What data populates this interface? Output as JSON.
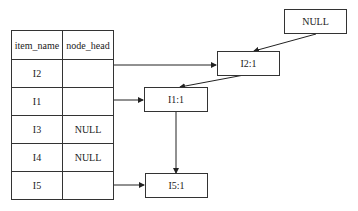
{
  "table": {
    "headers": [
      "item_name",
      "node_head"
    ],
    "rows": [
      {
        "item_name": "I2",
        "node_head": ""
      },
      {
        "item_name": "I1",
        "node_head": ""
      },
      {
        "item_name": "I3",
        "node_head": "NULL"
      },
      {
        "item_name": "I4",
        "node_head": "NULL"
      },
      {
        "item_name": "I5",
        "node_head": ""
      }
    ]
  },
  "nodes": {
    "null_node": "NULL",
    "i2_node": "I2:1",
    "i1_node": "I1:1",
    "i5_node": "I5:1"
  },
  "edges": [
    {
      "from": "I2 row",
      "to": "I2:1"
    },
    {
      "from": "I1 row",
      "to": "I1:1"
    },
    {
      "from": "I5 row",
      "to": "I5:1"
    },
    {
      "from": "NULL",
      "to": "I2:1"
    },
    {
      "from": "I2:1",
      "to": "I1:1"
    },
    {
      "from": "I1:1",
      "to": "I5:1"
    }
  ]
}
